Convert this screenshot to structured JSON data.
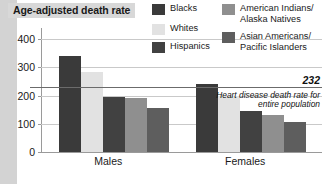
{
  "title": "Age-adjusted death rate",
  "legend": {
    "items": [
      {
        "label": "Blacks",
        "color": "#3a3a3a",
        "col": 0,
        "row": 0
      },
      {
        "label": "Whites",
        "color": "#e2e2e2",
        "col": 0,
        "row": 1
      },
      {
        "label": "Hispanics",
        "color": "#414141",
        "col": 0,
        "row": 2
      },
      {
        "label": "American Indians/\nAlaska Natives",
        "color": "#8f8f8f",
        "col": 1,
        "row": 0
      },
      {
        "label": "Asian Americans/\nPacific Islanders",
        "color": "#5e5e5e",
        "col": 1,
        "row": 1
      }
    ]
  },
  "reference": {
    "value": "232",
    "note": "Heart disease death rate for entire population",
    "value_num": 232,
    "color": "#6b6b6b"
  },
  "chart_data": {
    "type": "bar",
    "title": "Age-adjusted death rate",
    "xlabel": "",
    "ylabel": "Age-adjusted death rate",
    "ylim": [
      0,
      440
    ],
    "yticks": [
      0,
      100,
      200,
      300,
      400
    ],
    "ytick_labels": [
      "0",
      "100",
      "200",
      "300",
      "400"
    ],
    "grid": true,
    "legend_position": "top-right",
    "categories": [
      "Males",
      "Females"
    ],
    "series": [
      {
        "name": "Blacks",
        "color": "#3a3a3a",
        "values": [
          340,
          240
        ]
      },
      {
        "name": "Whites",
        "color": "#e2e2e2",
        "values": [
          285,
          200
        ]
      },
      {
        "name": "Hispanics",
        "color": "#414141",
        "values": [
          196,
          145
        ]
      },
      {
        "name": "American Indians/Alaska Natives",
        "color": "#8f8f8f",
        "values": [
          190,
          130
        ]
      },
      {
        "name": "Asian Americans/Pacific Islanders",
        "color": "#5e5e5e",
        "values": [
          155,
          105
        ]
      }
    ],
    "annotations": [
      {
        "type": "hline",
        "value": 232,
        "label": "232",
        "note": "Heart disease death rate for entire population"
      }
    ]
  }
}
